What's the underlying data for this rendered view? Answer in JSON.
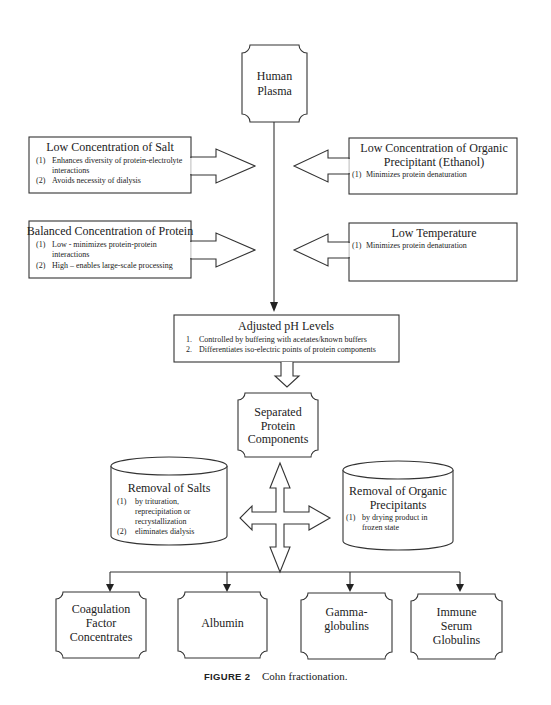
{
  "diagram": {
    "source": {
      "label": [
        "Human",
        "Plasma"
      ]
    },
    "conditions": [
      {
        "id": "salt",
        "title": [
          "Low Concentration of Salt"
        ],
        "items": [
          {
            "num": "(1)",
            "lines": [
              "Enhances diversity of protein-electrolyte",
              "interactions"
            ]
          },
          {
            "num": "(2)",
            "lines": [
              "Avoids necessity of dialysis"
            ]
          }
        ]
      },
      {
        "id": "organic",
        "title": [
          "Low Concentration of Organic",
          "Precipitant (Ethanol)"
        ],
        "items": [
          {
            "num": "(1)",
            "lines": [
              "Minimizes protein denaturation"
            ]
          }
        ]
      },
      {
        "id": "protein",
        "title": [
          "Balanced Concentration of Protein"
        ],
        "items": [
          {
            "num": "(1)",
            "lines": [
              "Low - minimizes protein-protein",
              "interactions"
            ]
          },
          {
            "num": "(2)",
            "lines": [
              "High – enables large-scale processing"
            ]
          }
        ]
      },
      {
        "id": "temperature",
        "title": [
          "Low Temperature"
        ],
        "items": [
          {
            "num": "(1)",
            "lines": [
              "Minimizes protein denaturation"
            ]
          }
        ]
      }
    ],
    "ph": {
      "title": "Adjusted pH Levels",
      "items": [
        {
          "num": "1.",
          "text": "Controlled by buffering with acetates/known buffers"
        },
        {
          "num": "2.",
          "text": "Differentiates iso-electric points of protein components"
        }
      ]
    },
    "separated": {
      "label": [
        "Separated",
        "Protein",
        "Components"
      ]
    },
    "removals": [
      {
        "id": "salts",
        "title": [
          "Removal of Salts"
        ],
        "items": [
          {
            "num": "(1)",
            "lines": [
              "by trituration,",
              "reprecipitation or",
              "recrystallization"
            ]
          },
          {
            "num": "(2)",
            "lines": [
              "eliminates dialysis"
            ]
          }
        ]
      },
      {
        "id": "organic-precipitants",
        "title": [
          "Removal of Organic",
          "Precipitants"
        ],
        "items": [
          {
            "num": "(1)",
            "lines": [
              "by drying product in",
              "frozen state"
            ]
          }
        ]
      }
    ],
    "products": [
      {
        "label": [
          "Coagulation",
          "Factor",
          "Concentrates"
        ]
      },
      {
        "label": [
          "Albumin"
        ]
      },
      {
        "label": [
          "Gamma-",
          "globulins"
        ]
      },
      {
        "label": [
          "Immune",
          "Serum",
          "Globulins"
        ]
      }
    ]
  },
  "caption": {
    "figure": "FIGURE 2",
    "text": "Cohn fractionation."
  }
}
